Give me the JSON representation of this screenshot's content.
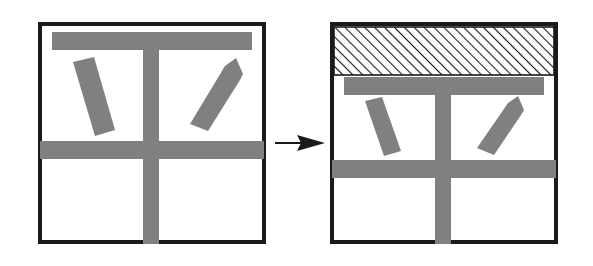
{
  "figure": {
    "type": "schematic-diagram",
    "title": "Before and after transformation of a framed panel assembly",
    "description": "Two square framed panels connected by a left-to-right arrow. The left panel shows a grey top rail, a central vertical mullion, a horizontal transom and two tilted grey bars. The right panel shows the same assembly with an added diagonally hatched band across the top.",
    "background_color": "#ffffff",
    "stroke_color": "#1a1a1a",
    "fill_gray": "#808080",
    "hatch_color": "#1a1a1a"
  },
  "panels": [
    {
      "id": "panel-before",
      "label": "Before",
      "frame": {
        "x": 38,
        "y": 22,
        "width": 228,
        "height": 222,
        "border_width": 4
      },
      "top_rail": {
        "x": 52,
        "y": 32,
        "width": 200,
        "height": 18
      },
      "mullion": {
        "x": 143,
        "y": 32,
        "width": 16,
        "height": 212
      },
      "transom": {
        "x": 40,
        "y": 141,
        "width": 224,
        "height": 18
      },
      "tilted_bars": [
        {
          "id": "left-tilted-bar",
          "angle_deg": 12,
          "length": 80,
          "thickness": 20,
          "center_x": 95,
          "center_y": 98
        },
        {
          "id": "right-tilted-bar",
          "angle_deg": -16,
          "length": 80,
          "thickness": 20,
          "center_x": 212,
          "center_y": 96
        }
      ],
      "hatched_band": null
    },
    {
      "id": "panel-after",
      "label": "After",
      "frame": {
        "x": 330,
        "y": 22,
        "width": 228,
        "height": 222,
        "border_width": 4
      },
      "top_rail": {
        "x": 344,
        "y": 77,
        "width": 200,
        "height": 18
      },
      "mullion": {
        "x": 435,
        "y": 77,
        "width": 16,
        "height": 167
      },
      "transom": {
        "x": 332,
        "y": 160,
        "width": 224,
        "height": 18
      },
      "tilted_bars": [
        {
          "id": "left-tilted-bar",
          "angle_deg": 12,
          "length": 64,
          "thickness": 19,
          "center_x": 383,
          "center_y": 123
        },
        {
          "id": "right-tilted-bar",
          "angle_deg": -16,
          "length": 64,
          "thickness": 19,
          "center_x": 499,
          "center_y": 121
        }
      ],
      "hatched_band": {
        "id": "hatched-band",
        "x": 332,
        "y": 26,
        "width": 224,
        "height": 49,
        "hatch_angle_deg": 45,
        "hatch_spacing": 7,
        "hatch_line_width": 2.2
      }
    }
  ],
  "arrow": {
    "id": "transition-arrow",
    "direction": "right",
    "shaft": {
      "x1": 275,
      "y1": 143,
      "x2": 313,
      "y2": 143,
      "width": 2
    },
    "head": {
      "tip_x": 325,
      "tip_y": 143,
      "back_x": 297,
      "half_height": 8
    }
  }
}
